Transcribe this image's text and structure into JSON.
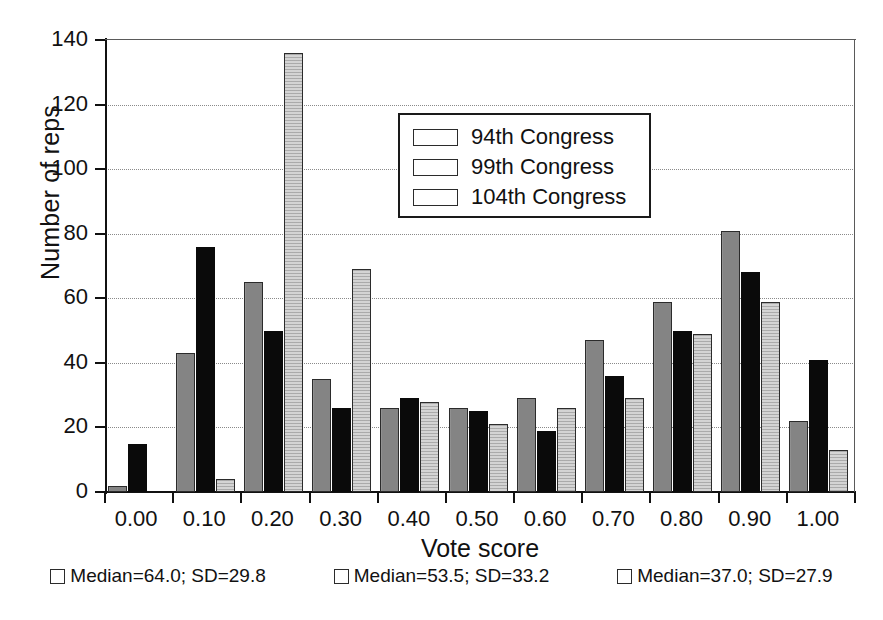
{
  "chart_data": {
    "type": "bar",
    "title": "",
    "xlabel": "Vote score",
    "ylabel": "Number of reps",
    "categories": [
      "0.00",
      "0.10",
      "0.20",
      "0.30",
      "0.40",
      "0.50",
      "0.60",
      "0.70",
      "0.80",
      "0.90",
      "1.00"
    ],
    "series": [
      {
        "name": "94th Congress",
        "color": "#848484",
        "values": [
          2,
          43,
          65,
          35,
          26,
          26,
          29,
          47,
          59,
          81,
          22
        ]
      },
      {
        "name": "99th Congress",
        "color": "#0a0a0a",
        "values": [
          15,
          76,
          50,
          26,
          29,
          25,
          19,
          36,
          50,
          68,
          41
        ]
      },
      {
        "name": "104th Congress",
        "color": "#d4d4d4",
        "values": [
          0,
          4,
          136,
          69,
          28,
          21,
          26,
          29,
          49,
          59,
          13
        ]
      }
    ],
    "ylim": [
      0,
      140
    ],
    "yticks": [
      0,
      20,
      40,
      60,
      80,
      100,
      120,
      140
    ],
    "ytick_labels": [
      "0",
      "20",
      "40",
      "60",
      "80",
      "100",
      "120",
      "140"
    ],
    "grid": true,
    "legend_position": "upper center"
  },
  "legend": {
    "items": [
      {
        "label": "94th Congress",
        "swatch": "series-0-swatch"
      },
      {
        "label": "99th Congress",
        "swatch": "series-1-swatch"
      },
      {
        "label": "104th Congress",
        "swatch": "series-2-swatch"
      }
    ]
  },
  "footer": {
    "items": [
      {
        "label": "Median=64.0; SD=29.8"
      },
      {
        "label": "Median=53.5; SD=33.2"
      },
      {
        "label": "Median=37.0; SD=27.9"
      }
    ]
  }
}
